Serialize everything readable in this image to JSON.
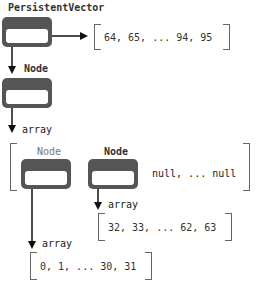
{
  "root": {
    "label": "PersistentVector",
    "tail_values": "64, 65, ... 94, 95"
  },
  "root_node": {
    "label": "Node",
    "pointer_label": "array"
  },
  "level1_array": {
    "children": [
      {
        "label": "Node",
        "style": "light"
      },
      {
        "label": "Node",
        "style": "bold"
      }
    ],
    "rest": "null, ... null"
  },
  "leaf_arrays": [
    {
      "pointer_label": "array",
      "values": "32, 33, ... 62, 63"
    },
    {
      "pointer_label": "array",
      "values": "0, 1, ... 30, 31"
    }
  ],
  "colors": {
    "node_fill": "#555555",
    "bracket": "#666666",
    "arrow": "#111111"
  }
}
